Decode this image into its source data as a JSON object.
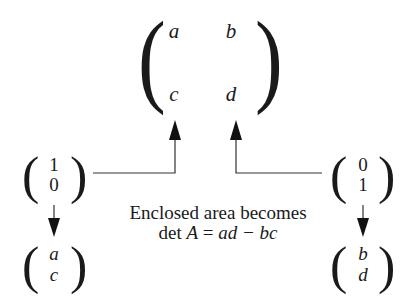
{
  "matrix": {
    "entries": {
      "a": "a",
      "b": "b",
      "c": "c",
      "d": "d"
    }
  },
  "left_vector": {
    "input": {
      "top": "1",
      "bottom": "0"
    },
    "output": {
      "top": "a",
      "bottom": "c"
    }
  },
  "right_vector": {
    "input": {
      "top": "0",
      "bottom": "1"
    },
    "output": {
      "top": "b",
      "bottom": "d"
    }
  },
  "caption": {
    "line1": "Enclosed area becomes",
    "line2_prefix": "det ",
    "line2_var": "A",
    "line2_eq": " = ",
    "line2_expr": "ad − bc"
  },
  "colors": {
    "ink": "#1a1a1a",
    "background": "#ffffff"
  }
}
